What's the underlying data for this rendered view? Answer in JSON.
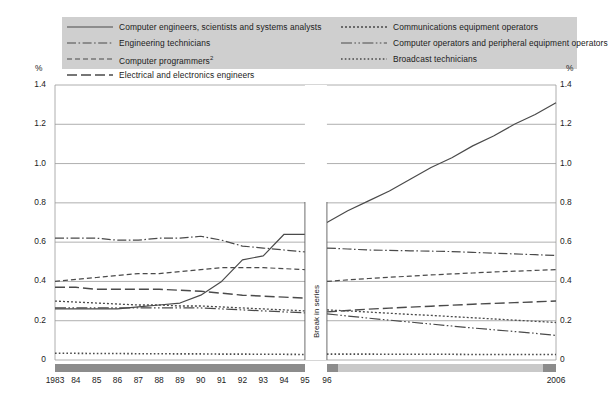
{
  "chart_data": {
    "type": "line",
    "title": "",
    "subtitle": "",
    "xlabel": "",
    "ylabel": "%",
    "ylabel_right": "%",
    "ylim": [
      0,
      1.4
    ],
    "yticks": [
      "0",
      "0.2",
      "0.4",
      "0.6",
      "0.8",
      "1.0",
      "1.2",
      "1.4"
    ],
    "ytick_values": [
      0,
      0.2,
      0.4,
      0.6,
      0.8,
      1.0,
      1.2,
      1.4
    ],
    "grid": true,
    "legend_position": "top",
    "x": [
      1983,
      1984,
      1985,
      1986,
      1987,
      1988,
      1989,
      1990,
      1991,
      1992,
      1993,
      1994,
      1995,
      1996,
      1997,
      1998,
      1999,
      2000,
      2001,
      2002,
      2003,
      2004,
      2005,
      2006
    ],
    "xtick_labels": [
      "1983",
      "84",
      "85",
      "86",
      "87",
      "88",
      "89",
      "90",
      "91",
      "92",
      "93",
      "94",
      "95",
      "96",
      "2006"
    ],
    "xtick_years": [
      1983,
      1984,
      1985,
      1986,
      1987,
      1988,
      1989,
      1990,
      1991,
      1992,
      1993,
      1994,
      1995,
      1996,
      2006
    ],
    "break_in_series": {
      "label": "Break in series",
      "between": [
        1995,
        1996
      ]
    },
    "annotations": [
      {
        "text": "Break in series",
        "orientation": "vertical",
        "x_between": [
          1995,
          1996
        ]
      }
    ],
    "series": [
      {
        "name": "Computer engineers, scientists and systems analysts",
        "style": "solid",
        "values_pre": [
          0.26,
          0.26,
          0.26,
          0.26,
          0.27,
          0.28,
          0.29,
          0.33,
          0.4,
          0.51,
          0.53,
          0.64,
          0.64
        ],
        "values_post": [
          0.7,
          0.76,
          0.81,
          0.86,
          0.92,
          0.98,
          1.03,
          1.09,
          1.14,
          1.2,
          1.25,
          1.31
        ]
      },
      {
        "name": "Engineering technicians",
        "style": "dash-dot",
        "values_pre": [
          0.62,
          0.62,
          0.62,
          0.61,
          0.61,
          0.62,
          0.62,
          0.63,
          0.61,
          0.58,
          0.57,
          0.56,
          0.55
        ],
        "values_post": [
          0.57,
          0.565,
          0.56,
          0.558,
          0.556,
          0.554,
          0.552,
          0.548,
          0.544,
          0.54,
          0.536,
          0.532
        ]
      },
      {
        "name": "Computer programmers",
        "superscript": "2",
        "style": "dashed-short",
        "values_pre": [
          0.4,
          0.41,
          0.42,
          0.43,
          0.44,
          0.44,
          0.45,
          0.46,
          0.47,
          0.47,
          0.47,
          0.465,
          0.46
        ],
        "values_post": [
          0.4,
          0.408,
          0.415,
          0.421,
          0.427,
          0.433,
          0.438,
          0.443,
          0.448,
          0.452,
          0.456,
          0.46
        ]
      },
      {
        "name": "Electrical and electronics engineers",
        "style": "dashed-long",
        "values_pre": [
          0.37,
          0.37,
          0.36,
          0.36,
          0.36,
          0.36,
          0.355,
          0.35,
          0.34,
          0.33,
          0.325,
          0.32,
          0.315
        ],
        "values_post": [
          0.245,
          0.252,
          0.259,
          0.264,
          0.269,
          0.274,
          0.279,
          0.284,
          0.288,
          0.292,
          0.296,
          0.3
        ]
      },
      {
        "name": "Communications equipment operators",
        "style": "dotted",
        "values_pre": [
          0.3,
          0.295,
          0.29,
          0.285,
          0.28,
          0.28,
          0.275,
          0.275,
          0.27,
          0.265,
          0.26,
          0.255,
          0.25
        ],
        "values_post": [
          0.255,
          0.25,
          0.244,
          0.238,
          0.232,
          0.227,
          0.221,
          0.215,
          0.209,
          0.203,
          0.197,
          0.191
        ]
      },
      {
        "name": "Computer operators and peripheral equipment operators",
        "style": "long-dash-dot-dot",
        "values_pre": [
          0.265,
          0.265,
          0.265,
          0.265,
          0.265,
          0.265,
          0.265,
          0.265,
          0.26,
          0.255,
          0.25,
          0.245,
          0.24
        ],
        "values_post": [
          0.235,
          0.224,
          0.213,
          0.203,
          0.193,
          0.183,
          0.173,
          0.163,
          0.154,
          0.145,
          0.136,
          0.125
        ]
      },
      {
        "name": "Broadcast technicians",
        "style": "fine-dotted",
        "values_pre": [
          0.034,
          0.034,
          0.033,
          0.033,
          0.032,
          0.032,
          0.031,
          0.031,
          0.03,
          0.03,
          0.029,
          0.029,
          0.028
        ],
        "values_post": [
          0.03,
          0.03,
          0.03,
          0.029,
          0.029,
          0.029,
          0.029,
          0.028,
          0.028,
          0.028,
          0.028,
          0.028
        ]
      }
    ]
  },
  "legend": {
    "left_column": [
      {
        "label": "Computer engineers, scientists and systems analysts",
        "sup": "",
        "style": "solid"
      },
      {
        "label": "Engineering technicians",
        "sup": "",
        "style": "dash-dot"
      },
      {
        "label": "Computer programmers",
        "sup": "2",
        "style": "dashed-short"
      },
      {
        "label": "Electrical and electronics engineers",
        "sup": "",
        "style": "dashed-long"
      }
    ],
    "right_column": [
      {
        "label": "Communications equipment operators",
        "sup": "",
        "style": "dotted"
      },
      {
        "label": "Computer operators and peripheral equipment operators",
        "sup": "",
        "style": "long-dash-dot-dot"
      },
      {
        "label": "Broadcast technicians",
        "sup": "",
        "style": "fine-dotted"
      }
    ]
  },
  "axes": {
    "unit_left": "%",
    "unit_right": "%"
  },
  "colors": {
    "line": "#4a4a4a",
    "grid": "#9a9a9a",
    "legend_background": "#cfcfcf",
    "axis_band_light": "#c9c9c9",
    "axis_band_dark": "#8c8c8c",
    "text": "#1b1b1b"
  }
}
